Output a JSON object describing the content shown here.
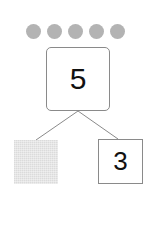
{
  "diagram": {
    "type": "number-bond",
    "counters": {
      "count": 5,
      "color": "#b3b3b3"
    },
    "whole": {
      "value": "5"
    },
    "parts": [
      {
        "value": "",
        "state": "hidden-shaded",
        "color": "#e6e6e6"
      },
      {
        "value": "3"
      }
    ],
    "line_color": "#8a8a8a"
  }
}
